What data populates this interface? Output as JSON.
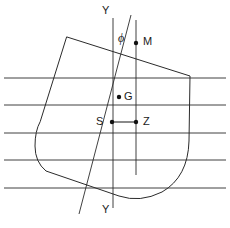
{
  "figure": {
    "name": "ship-transverse-stability-diagram",
    "type": "diagram",
    "width": 230,
    "height": 228,
    "background_color": "#ffffff",
    "line_color": "#2b2b2b"
  },
  "labels": {
    "y_top": "Y",
    "y_bottom": "Y",
    "phi": "ϕ",
    "metacentre": "M",
    "centre_of_gravity": "G",
    "centre_of_buoyancy": "S",
    "righting_arm_point": "Z"
  },
  "points": [
    {
      "id": "M",
      "label": "M",
      "x": 136,
      "y": 43,
      "label_x": 142,
      "label_y": 37
    },
    {
      "id": "G",
      "label": "G",
      "x": 119,
      "y": 97,
      "label_x": 124,
      "label_y": 97
    },
    {
      "id": "S",
      "label": "S",
      "x": 112,
      "y": 122,
      "label_x": 98,
      "label_y": 115
    },
    {
      "id": "Z",
      "label": "Z",
      "x": 136,
      "y": 122,
      "label_x": 142,
      "label_y": 115
    }
  ],
  "annotations": {
    "phi_x": 121,
    "phi_y": 36,
    "y_top_x": 106,
    "y_top_y": 8,
    "y_bottom_x": 106,
    "y_bottom_y": 207
  },
  "geometry": {
    "vertical_axis": {
      "x": 113,
      "y1": 18,
      "y2": 208
    },
    "heel_axis": {
      "x1": 131,
      "y1": 15,
      "x2": 78,
      "y2": 215
    },
    "metacentric_vertical": {
      "x": 136,
      "y1": 20,
      "y2": 175
    },
    "righting_arm": {
      "x1": 112,
      "y1": 122,
      "x2": 136,
      "y2": 122
    },
    "waterlines_y": [
      78,
      105,
      133,
      160,
      188
    ],
    "waterline_x_start": 4,
    "waterline_x_end": 226,
    "hull_outline": "M 67 37 L 190 76 L 189 140 Q 188 176 163 192 Q 142 203 120 197 L 45 172 Q 35 163 35 146 Q 35 132 40 124 L 67 37 Z"
  },
  "elements": {
    "hull_name": "ship-hull-section",
    "waterline_name": "waterline",
    "axis_name": "vertical-reference-axis",
    "heel_name": "heeled-centreline-axis",
    "metacentric_name": "metacentric-vertical-line",
    "arm_name": "righting-arm-gz-line"
  }
}
